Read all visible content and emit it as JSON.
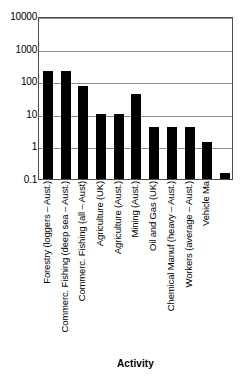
{
  "chart_data": {
    "type": "bar",
    "title": "",
    "xlabel": "Activity",
    "ylabel": "",
    "yscale": "log",
    "ylim": [
      0.1,
      10000
    ],
    "ytick_labels": [
      "10000",
      "1000",
      "100",
      "10",
      "1",
      "0.1"
    ],
    "ytick_values": [
      10000,
      1000,
      100,
      10,
      1,
      0.1
    ],
    "grid": true,
    "grid_axis": "y",
    "legend": false,
    "bar_color": "#000000",
    "categories": [
      "Forestry (loggers – Aust.)",
      "Commerc. Fishing (deep sea – Aust.)",
      "Commerc. Fishing (all – Aust)",
      "Agriculture (UK)",
      "Agriculture (Aust.)",
      "Mining (Aust.)",
      "Oil and Gas (UK)",
      "Chemical Manuf (heavy – Aust.)",
      "Workers (average – Aust.)",
      "Vehicle Ma"
    ],
    "values": [
      200,
      200,
      70,
      10,
      10,
      40,
      4,
      4,
      4,
      1.4
    ],
    "extra_bar_value": 0.15,
    "n_bars": 11
  },
  "axis": {
    "x_title": "Activity"
  }
}
